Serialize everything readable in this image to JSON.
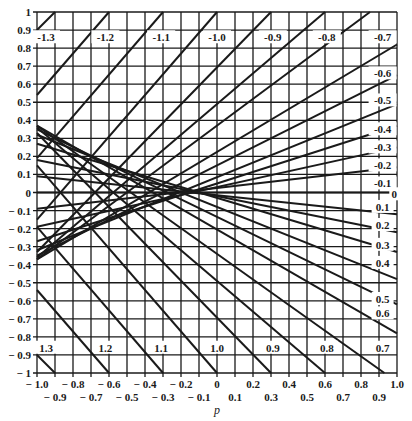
{
  "chart_data": {
    "type": "line",
    "title": "",
    "xlabel": "p",
    "ylabel": "",
    "xlim": [
      -1.0,
      1.0
    ],
    "ylim": [
      -1.0,
      1.0
    ],
    "grid": true,
    "grid_step": 0.1,
    "legend": "none (lines labeled inline)",
    "x_ticks_row1": [
      "-1.0",
      "-0.8",
      "-0.6",
      "-0.4",
      "-0.2",
      "0",
      "0.2",
      "0.4",
      "0.6",
      "0.8",
      "1.0"
    ],
    "x_ticks_row2": [
      "-0.9",
      "-0.7",
      "-0.5",
      "-0.3",
      "-0.1",
      "0.1",
      "0.3",
      "0.5",
      "0.7",
      "0.9"
    ],
    "y_ticks": [
      "1",
      "0.9",
      "0.8",
      "0.7",
      "0.6",
      "0.5",
      "0.4",
      "0.3",
      "0.2",
      "0.1",
      "0",
      "-0.1",
      "-0.2",
      "-0.3",
      "-0.4",
      "-0.5",
      "-0.6",
      "-0.7",
      "-0.8",
      "-0.9",
      "-1"
    ],
    "series": [
      {
        "name": "-1.3",
        "points": [
          [
            -1.0,
            0.9
          ],
          [
            -0.9,
            1.0
          ]
        ]
      },
      {
        "name": "-1.2",
        "points": [
          [
            -1.0,
            0.54
          ],
          [
            -0.6,
            1.0
          ]
        ]
      },
      {
        "name": "-1.1",
        "points": [
          [
            -1.0,
            0.19
          ],
          [
            -0.3,
            1.0
          ]
        ]
      },
      {
        "name": "-1.0",
        "points": [
          [
            -1.0,
            -0.15
          ],
          [
            0.0,
            1.0
          ]
        ]
      },
      {
        "name": "-0.9",
        "points": [
          [
            -1.0,
            -0.33
          ],
          [
            0.3,
            1.0
          ]
        ]
      },
      {
        "name": "-0.8",
        "points": [
          [
            -1.0,
            -0.36
          ],
          [
            0.6,
            1.0
          ]
        ]
      },
      {
        "name": "-0.7",
        "points": [
          [
            -1.0,
            -0.37
          ],
          [
            0.85,
            1.0
          ]
        ]
      },
      {
        "name": "-0.6",
        "points": [
          [
            -1.0,
            -0.37
          ],
          [
            1.0,
            0.82
          ]
        ]
      },
      {
        "name": "-0.5",
        "points": [
          [
            -1.0,
            -0.35
          ],
          [
            1.0,
            0.65
          ]
        ]
      },
      {
        "name": "-0.4",
        "points": [
          [
            -1.0,
            -0.32
          ],
          [
            1.0,
            0.49
          ]
        ]
      },
      {
        "name": "-0.3",
        "points": [
          [
            -1.0,
            -0.27
          ],
          [
            1.0,
            0.37
          ]
        ]
      },
      {
        "name": "-0.2",
        "points": [
          [
            -1.0,
            -0.19
          ],
          [
            1.0,
            0.25
          ]
        ]
      },
      {
        "name": "-0.1",
        "points": [
          [
            -1.0,
            -0.09
          ],
          [
            1.0,
            0.14
          ]
        ]
      },
      {
        "name": "0",
        "points": [
          [
            -1.0,
            0.0
          ],
          [
            1.0,
            0.0
          ]
        ]
      },
      {
        "name": "0.1",
        "points": [
          [
            -1.0,
            0.09
          ],
          [
            1.0,
            -0.12
          ]
        ]
      },
      {
        "name": "0.2",
        "points": [
          [
            -1.0,
            0.18
          ],
          [
            1.0,
            -0.22
          ]
        ]
      },
      {
        "name": "0.3",
        "points": [
          [
            -1.0,
            0.27
          ],
          [
            1.0,
            -0.33
          ]
        ]
      },
      {
        "name": "0.4",
        "points": [
          [
            -1.0,
            0.32
          ],
          [
            1.0,
            -0.48
          ]
        ]
      },
      {
        "name": "0.5",
        "points": [
          [
            -1.0,
            0.35
          ],
          [
            1.0,
            -0.62
          ]
        ]
      },
      {
        "name": "0.6",
        "points": [
          [
            -1.0,
            0.37
          ],
          [
            1.0,
            -0.78
          ]
        ]
      },
      {
        "name": "0.7",
        "points": [
          [
            -1.0,
            0.37
          ],
          [
            0.93,
            -1.0
          ]
        ]
      },
      {
        "name": "0.8",
        "points": [
          [
            -1.0,
            0.36
          ],
          [
            0.6,
            -1.0
          ]
        ]
      },
      {
        "name": "0.9",
        "points": [
          [
            -1.0,
            0.33
          ],
          [
            0.3,
            -1.0
          ]
        ]
      },
      {
        "name": "1.0",
        "points": [
          [
            -1.0,
            0.15
          ],
          [
            0.0,
            -1.0
          ]
        ]
      },
      {
        "name": "1.1",
        "points": [
          [
            -1.0,
            -0.19
          ],
          [
            -0.3,
            -1.0
          ]
        ]
      },
      {
        "name": "1.2",
        "points": [
          [
            -1.0,
            -0.54
          ],
          [
            -0.6,
            -1.0
          ]
        ]
      },
      {
        "name": "1.3",
        "points": [
          [
            -1.0,
            -0.9
          ],
          [
            -0.9,
            -1.0
          ]
        ]
      }
    ],
    "annotations": [
      {
        "text": "-1.3",
        "x": -0.95,
        "y": 0.86
      },
      {
        "text": "-1.2",
        "x": -0.62,
        "y": 0.86
      },
      {
        "text": "-1.1",
        "x": -0.31,
        "y": 0.86
      },
      {
        "text": "-1.0",
        "x": 0.0,
        "y": 0.86
      },
      {
        "text": "-0.9",
        "x": 0.31,
        "y": 0.86
      },
      {
        "text": "-0.8",
        "x": 0.61,
        "y": 0.86
      },
      {
        "text": "-0.7",
        "x": 0.92,
        "y": 0.86
      },
      {
        "text": "-0.6",
        "x": 0.92,
        "y": 0.66
      },
      {
        "text": "-0.5",
        "x": 0.92,
        "y": 0.51
      },
      {
        "text": "-0.4",
        "x": 0.92,
        "y": 0.35
      },
      {
        "text": "-0.3",
        "x": 0.92,
        "y": 0.25
      },
      {
        "text": "-0.2",
        "x": 0.92,
        "y": 0.15
      },
      {
        "text": "-0.1",
        "x": 0.92,
        "y": 0.05
      },
      {
        "text": "0",
        "x": 0.985,
        "y": -0.01
      },
      {
        "text": "0.1",
        "x": 0.92,
        "y": -0.08
      },
      {
        "text": "0.2",
        "x": 0.92,
        "y": -0.18
      },
      {
        "text": "0.3",
        "x": 0.92,
        "y": -0.29
      },
      {
        "text": "0.4",
        "x": 0.92,
        "y": -0.39
      },
      {
        "text": "0.5",
        "x": 0.92,
        "y": -0.59
      },
      {
        "text": "0.6",
        "x": 0.92,
        "y": -0.67
      },
      {
        "text": "0.7",
        "x": 0.92,
        "y": -0.86
      },
      {
        "text": "0.8",
        "x": 0.61,
        "y": -0.86
      },
      {
        "text": "0.9",
        "x": 0.31,
        "y": -0.86
      },
      {
        "text": "1.0",
        "x": 0.0,
        "y": -0.86
      },
      {
        "text": "1.1",
        "x": -0.31,
        "y": -0.86
      },
      {
        "text": "1.2",
        "x": -0.62,
        "y": -0.86
      },
      {
        "text": "1.3",
        "x": -0.95,
        "y": -0.86
      }
    ]
  },
  "colors": {
    "ink": "#1a1a1a",
    "background": "#ffffff",
    "grid": "#1a1a1a"
  }
}
